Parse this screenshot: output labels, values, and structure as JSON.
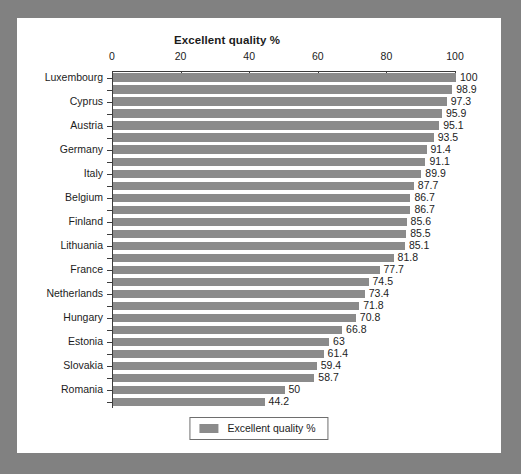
{
  "chart_data": {
    "type": "bar",
    "orientation": "horizontal",
    "title": "Excellent quality %",
    "xlabel": "",
    "ylabel": "",
    "xlim": [
      0,
      100
    ],
    "xticks": [
      0,
      20,
      40,
      60,
      80,
      100
    ],
    "grid": false,
    "legend": {
      "position": "bottom",
      "entries": [
        {
          "label": "Excellent quality %",
          "color": "#8b8b8b"
        }
      ]
    },
    "series_color": "#8b8b8b",
    "categories": [
      "Luxembourg",
      "",
      "Cyprus",
      "",
      "Austria",
      "",
      "Germany",
      "",
      "Italy",
      "",
      "Belgium",
      "",
      "Finland",
      "",
      "Lithuania",
      "",
      "France",
      "",
      "Netherlands",
      "",
      "Hungary",
      "",
      "Estonia",
      "",
      "Slovakia",
      "",
      "Romania",
      ""
    ],
    "values": [
      100,
      98.9,
      97.3,
      95.9,
      95.1,
      93.5,
      91.4,
      91.1,
      89.9,
      87.7,
      86.7,
      86.7,
      85.6,
      85.5,
      85.1,
      81.8,
      77.7,
      74.5,
      73.4,
      71.8,
      70.8,
      66.8,
      63,
      61.4,
      59.4,
      58.7,
      50,
      44.2
    ],
    "value_labels": [
      "100",
      "98.9",
      "97.3",
      "95.9",
      "95.1",
      "93.5",
      "91.4",
      "91.1",
      "89.9",
      "87.7",
      "86.7",
      "86.7",
      "85.6",
      "85.5",
      "85.1",
      "81.8",
      "77.7",
      "74.5",
      "73.4",
      "71.8",
      "70.8",
      "66.8",
      "63",
      "61.4",
      "59.4",
      "58.7",
      "50",
      "44.2"
    ]
  }
}
